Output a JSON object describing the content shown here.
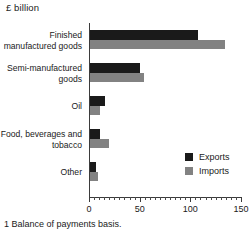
{
  "chart_data": {
    "type": "bar",
    "orientation": "horizontal",
    "title": "£ billion",
    "xlabel": "",
    "ylabel": "",
    "xlim": [
      0,
      150
    ],
    "grid": false,
    "legend_position": "inside-right",
    "categories": [
      "Finished manufactured goods",
      "Semi-manufactured goods",
      "Oil",
      "Food, beverages and tobacco",
      "Other"
    ],
    "series": [
      {
        "name": "Exports",
        "color": "#1a1a1a",
        "values": [
          107,
          49,
          15,
          10,
          6
        ]
      },
      {
        "name": "Imports",
        "color": "#828282",
        "values": [
          133,
          53,
          10,
          19,
          8
        ]
      }
    ],
    "xticks": [
      0,
      50,
      100,
      150
    ],
    "xtick_labels": [
      "0",
      "50",
      "100",
      "150"
    ],
    "xminor_step": 5,
    "footnote": "1 Balance of payments basis."
  }
}
